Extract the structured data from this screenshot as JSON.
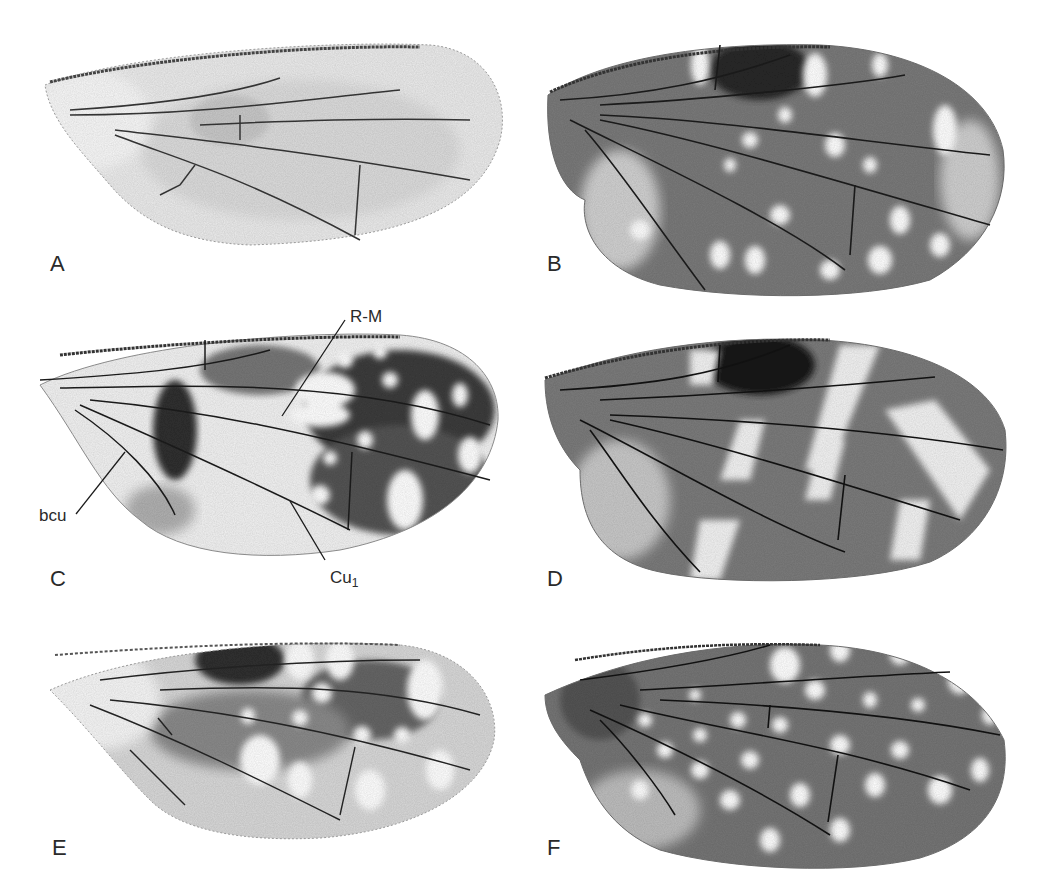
{
  "figure": {
    "panels": [
      {
        "label": "A",
        "pattern": "hyaline, lightly infuscated"
      },
      {
        "label": "B",
        "pattern": "dark with scattered white spots"
      },
      {
        "label": "C",
        "pattern": "banded with white spots, basal area pale"
      },
      {
        "label": "D",
        "pattern": "dark with oblique white bands"
      },
      {
        "label": "E",
        "pattern": "moderately infuscated with white spots"
      },
      {
        "label": "F",
        "pattern": "dark with numerous white spots"
      }
    ],
    "annotations": [
      {
        "text": "R-M",
        "panel": "C"
      },
      {
        "text": "bcu",
        "panel": "C"
      },
      {
        "text": "Cu",
        "subscript": "1",
        "panel": "C"
      }
    ]
  }
}
